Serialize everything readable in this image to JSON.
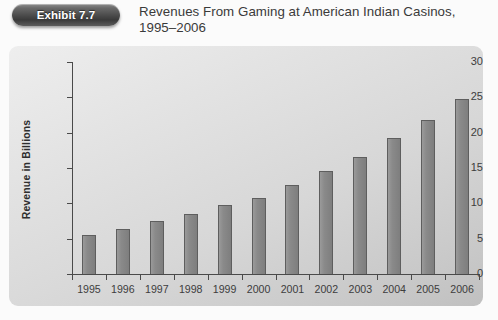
{
  "exhibit": {
    "badge_label": "Exhibit 7.7"
  },
  "title": "Revenues From Gaming at American Indian Casinos, 1995–2006",
  "chart_data": {
    "type": "bar",
    "title": "Revenues From Gaming at American Indian Casinos, 1995–2006",
    "xlabel": "",
    "ylabel": "Revenue in Billions",
    "categories": [
      "1995",
      "1996",
      "1997",
      "1998",
      "1999",
      "2000",
      "2001",
      "2002",
      "2003",
      "2004",
      "2005",
      "2006"
    ],
    "values": [
      5.5,
      6.3,
      7.5,
      8.5,
      9.8,
      10.8,
      12.6,
      14.6,
      16.5,
      19.2,
      21.8,
      24.7
    ],
    "ylim": [
      0,
      30
    ],
    "ytick_labels": [
      "0",
      "5",
      "10",
      "15",
      "20",
      "25",
      "30"
    ],
    "ytick_values": [
      0,
      5,
      10,
      15,
      20,
      25,
      30
    ],
    "grid": false,
    "legend": "none",
    "bar_color": "#888888",
    "bar_edge_color": "#5e5e5e",
    "plot_background": "#d9d9d9"
  }
}
